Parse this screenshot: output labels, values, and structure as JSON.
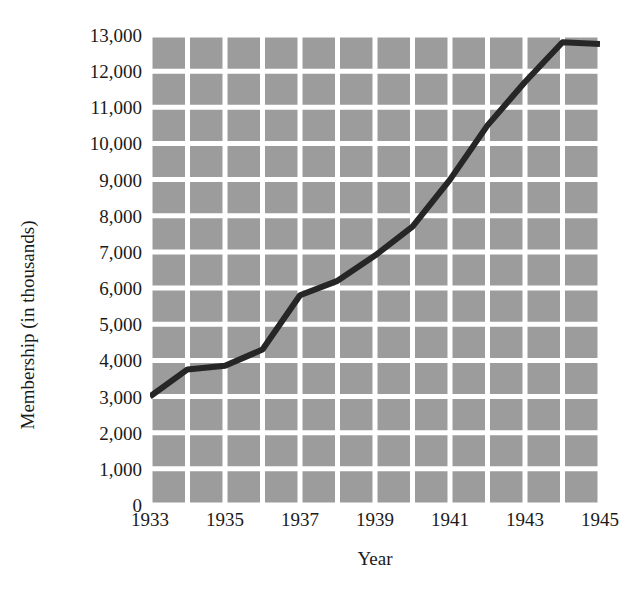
{
  "chart_data": {
    "type": "line",
    "title": "",
    "xlabel": "Year",
    "ylabel": "Membership (in thousands)",
    "x": [
      1933,
      1934,
      1935,
      1936,
      1937,
      1938,
      1939,
      1940,
      1941,
      1942,
      1943,
      1944,
      1945
    ],
    "values": [
      3000,
      3750,
      3850,
      4300,
      5800,
      6200,
      6900,
      7700,
      9000,
      10500,
      11700,
      12800,
      12750
    ],
    "series": [
      {
        "name": "Membership",
        "values": [
          3000,
          3750,
          3850,
          4300,
          5800,
          6200,
          6900,
          7700,
          9000,
          10500,
          11700,
          12800,
          12750
        ]
      }
    ],
    "xlim": [
      1933,
      1945
    ],
    "ylim": [
      0,
      13000
    ],
    "x_tick_labels": [
      "1933",
      "1935",
      "1937",
      "1939",
      "1941",
      "1943",
      "1945"
    ],
    "x_tick_values": [
      1933,
      1935,
      1937,
      1939,
      1941,
      1943,
      1945
    ],
    "y_tick_labels": [
      "13,000",
      "12,000",
      "11,000",
      "10,000",
      "9,000",
      "8,000",
      "7,000",
      "6,000",
      "5,000",
      "4,000",
      "3,000",
      "2,000",
      "1,000",
      "0"
    ],
    "y_tick_values": [
      13000,
      12000,
      11000,
      10000,
      9000,
      8000,
      7000,
      6000,
      5000,
      4000,
      3000,
      2000,
      1000,
      0
    ],
    "grid": true,
    "legend": "none",
    "colors": {
      "plot_background": "#9c9c9c",
      "gridline": "#ffffff",
      "line": "#262626",
      "page_background": "#ffffff",
      "text": "#1a1a1a"
    },
    "line_width": 6
  }
}
